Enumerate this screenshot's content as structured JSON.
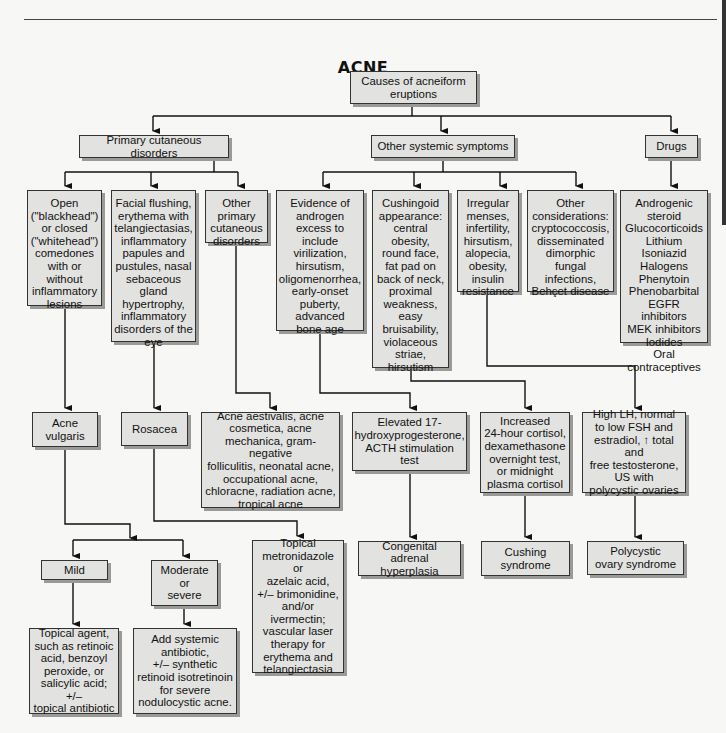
{
  "title": "ACNE",
  "nodes": {
    "root": "Causes of acneiform\neruptions",
    "primary": "Primary cutaneous disorders",
    "systemic": "Other systemic symptoms",
    "drugs": "Drugs",
    "comedones": "Open\n(\"blackhead\")\nor closed\n(\"whitehead\")\ncomedones\nwith or\nwithout\ninflammatory\nlesions",
    "flushing": "Facial flushing,\nerythema with\ntelangiectasias,\ninflammatory\npapules and\npustules, nasal\nsebaceous\ngland\nhypertrophy,\ninflammatory\ndisorders of the\neye",
    "other_primary": "Other\nprimary\ncutaneous\ndisorders",
    "androgen": "Evidence of\nandrogen\nexcess to\ninclude\nvirilization,\nhirsutism,\noligomenorrhea,\nearly-onset\npuberty,\nadvanced\nbone age",
    "cushingoid": "Cushingoid\nappearance:\ncentral\nobesity,\nround face,\nfat pad on\nback of neck,\nproximal\nweakness,\neasy\nbruisability,\nviolaceous\nstriae,\nhirsutism",
    "irregular": "Irregular\nmenses,\ninfertility,\nhirsutism,\nalopecia,\nobesity,\ninsulin\nresistance",
    "other_considerations": "Other\nconsiderations:\ncryptococcosis,\ndisseminated\ndimorphic\nfungal\ninfections,\nBehçet disease",
    "drug_list": "Androgenic\nsteroid\nGlucocorticoids\nLithium\nIsoniazid\nHalogens\nPhenytoin\nPhenobarbital\nEGFR inhibitors\nMEK inhibitors\nIodides\nOral\ncontraceptives",
    "acne_vulgaris": "Acne\nvulgaris",
    "rosacea": "Rosacea",
    "acne_variants": "Acne aestivalis, acne\ncosmetica, acne\nmechanica, gram-negative\nfolliculitis, neonatal acne,\noccupational acne,\nchloracne, radiation acne,\ntropical acne",
    "elevated_17": "Elevated 17-\nhydroxyprogesterone,\nACTH stimulation\ntest",
    "cortisol": "Increased\n24-hour cortisol,\ndexamethasone\novernight test,\nor midnight\nplasma cortisol",
    "lh": "High LH, normal\nto low FSH and\nestradiol, ↑ total and\nfree testosterone,\nUS with\npolycystic ovaries",
    "mild": "Mild",
    "moderate": "Moderate\nor\nsevere",
    "rosacea_tx": "Topical\nmetronidazole or\nazelaic acid,\n+/– brimonidine,\nand/or\nivermectin;\nvascular laser\ntherapy for\nerythema and\ntelangiectasia",
    "cah": "Congenital\nadrenal hyperplasia",
    "cushing": "Cushing\nsyndrome",
    "pcos": "Polycystic\novary syndrome",
    "mild_tx": "Topical agent,\nsuch as retinoic\nacid, benzoyl\nperoxide, or\nsalicylic acid; +/–\ntopical antibiotic",
    "moderate_tx": "Add systemic\nantibiotic,\n+/– synthetic\nretinoid isotretinoin\nfor severe\nnodulocystic acne."
  },
  "colors": {
    "box_fill": "#e2e2e0",
    "box_border": "#333333",
    "shadow": "#9a9a98",
    "line": "#111111"
  }
}
